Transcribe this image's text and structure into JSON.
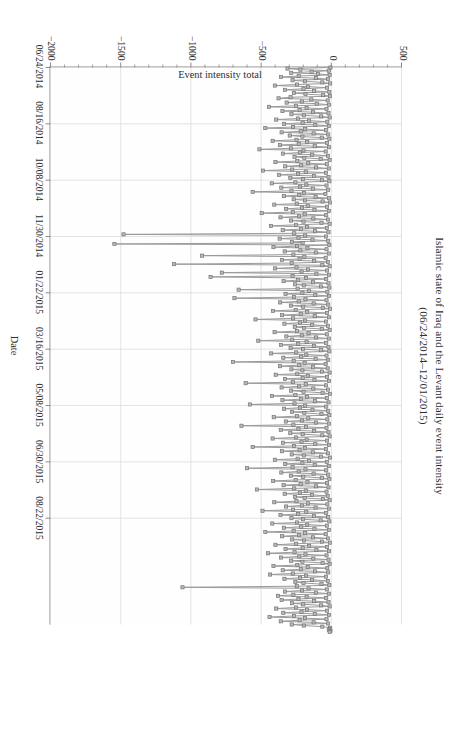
{
  "figure": {
    "title_line1": "Islamic state of Iraq and the Levant daily event intensity",
    "title_line2": "(06/24/2014–12/01/2015)",
    "orientation": "rotated-90-clockwise"
  },
  "colors": {
    "marker_fill": "#b9b9b9",
    "marker_stroke": "#6e6e6e",
    "line": "#9a9a9a",
    "axis": "#8a8a8a",
    "grid": "#dcdcdc",
    "text": "#2e2e2e",
    "background": "#ffffff"
  },
  "chart_data": {
    "type": "line",
    "title": "Islamic state of Iraq and the Levant daily event intensity (06/24/2014–12/01/2015)",
    "xlabel": "Date",
    "ylabel": "Event intensity total",
    "grid": true,
    "legend": false,
    "marker": "square",
    "xlim": [
      "06/24/2014",
      "12/01/2015"
    ],
    "ylim": [
      -2000,
      500
    ],
    "yticks": [
      500,
      0,
      -500,
      -1000,
      -1500,
      -2000
    ],
    "ytick_labels": [
      "500",
      "0",
      "−500",
      "−1000",
      "−1500",
      "−2000"
    ],
    "xtick_labels": [
      "06/24/2014",
      "08/16/2014",
      "10/08/2014",
      "11/30/2014",
      "01/22/2015",
      "03/16/2015",
      "05/08/2015",
      "06/30/2015",
      "08/22/2015"
    ],
    "xtick_positions": [
      0,
      53,
      106,
      159,
      212,
      265,
      318,
      371,
      424
    ],
    "x_total_days": 525,
    "series": [
      {
        "name": "Event intensity total",
        "values": [
          -6,
          -312,
          -220,
          -18,
          -140,
          -286,
          -96,
          -12,
          -232,
          -358,
          -110,
          -24,
          -276,
          -188,
          -64,
          -8,
          -244,
          -402,
          -166,
          -30,
          -198,
          -330,
          -122,
          -14,
          -266,
          -184,
          -58,
          -10,
          -290,
          -376,
          -142,
          -26,
          -210,
          -318,
          -104,
          -16,
          -252,
          -444,
          -176,
          -34,
          -226,
          -348,
          -130,
          -20,
          -284,
          -196,
          -72,
          -12,
          -238,
          -392,
          -158,
          -28,
          -204,
          -336,
          -114,
          -18,
          -272,
          -470,
          -186,
          -36,
          -218,
          -354,
          -126,
          -22,
          -296,
          -206,
          -68,
          -14,
          -248,
          -418,
          -172,
          -30,
          -232,
          -366,
          -118,
          -16,
          -288,
          -512,
          -198,
          -40,
          -224,
          -344,
          -136,
          -24,
          -262,
          -192,
          -76,
          -12,
          -242,
          -398,
          -164,
          -32,
          -214,
          -328,
          -108,
          -18,
          -278,
          -486,
          -182,
          -38,
          -236,
          -372,
          -124,
          -20,
          -292,
          -202,
          -66,
          -14,
          -256,
          -424,
          -178,
          -34,
          -222,
          -356,
          -132,
          -22,
          -284,
          -560,
          -194,
          -42,
          -228,
          -338,
          -112,
          -16,
          -268,
          -188,
          -62,
          -10,
          -246,
          -406,
          -168,
          -30,
          -208,
          -322,
          -120,
          -18,
          -274,
          -496,
          -190,
          -36,
          -230,
          -362,
          -128,
          -24,
          -286,
          -198,
          -70,
          -12,
          -252,
          -430,
          -174,
          -32,
          -216,
          -346,
          -116,
          -20,
          -264,
          -1480,
          -186,
          -38,
          -234,
          -368,
          -134,
          -22,
          -280,
          -204,
          -1545,
          -14,
          -244,
          -412,
          -170,
          -34,
          -220,
          -332,
          -110,
          -18,
          -270,
          -920,
          -192,
          -40,
          -226,
          -352,
          -122,
          -24,
          -282,
          -1120,
          -64,
          -12,
          -248,
          -400,
          -166,
          -30,
          -212,
          -780,
          -106,
          -16,
          -276,
          -860,
          -180,
          -36,
          -238,
          -340,
          -130,
          -20,
          -258,
          -196,
          -74,
          -14,
          -240,
          -660,
          -160,
          -28,
          -206,
          -326,
          -114,
          -18,
          -266,
          -690,
          -184,
          -34,
          -232,
          -364,
          -126,
          -22,
          -288,
          -200,
          -60,
          -10,
          -254,
          -416,
          -172,
          -30,
          -218,
          -350,
          -118,
          -16,
          -272,
          -540,
          -188,
          -38,
          -224,
          -334,
          -136,
          -24,
          -260,
          -194,
          -68,
          -12,
          -244,
          -404,
          -162,
          -32,
          -210,
          -320,
          -108,
          -18,
          -278,
          -520,
          -176,
          -36,
          -236,
          -358,
          -124,
          -20,
          -290,
          -202,
          -72,
          -14,
          -250,
          -428,
          -178,
          -34,
          -214,
          -342,
          -112,
          -22,
          -268,
          -700,
          -190,
          -40,
          -228,
          -366,
          -130,
          -26,
          -284,
          -206,
          -66,
          -12,
          -242,
          -396,
          -168,
          -30,
          -204,
          -330,
          -120,
          -16,
          -274,
          -610,
          -182,
          -38,
          -230,
          -354,
          -128,
          -24,
          -286,
          -198,
          -62,
          -10,
          -256,
          -422,
          -174,
          -32,
          -216,
          -348,
          -116,
          -20,
          -262,
          -580,
          -186,
          -36,
          -222,
          -336,
          -134,
          -22,
          -280,
          -192,
          -70,
          -14,
          -246,
          -410,
          -164,
          -28,
          -208,
          -324,
          -110,
          -18,
          -270,
          -640,
          -180,
          -34,
          -234,
          -360,
          -122,
          -20,
          -292,
          -204,
          -64,
          -12,
          -252,
          -418,
          -176,
          -30,
          -212,
          -344,
          -114,
          -16,
          -266,
          -560,
          -188,
          -38,
          -226,
          -352,
          -132,
          -24,
          -282,
          -196,
          -74,
          -10,
          -240,
          -402,
          -160,
          -32,
          -206,
          -328,
          -118,
          -18,
          -276,
          -600,
          -184,
          -36,
          -232,
          -356,
          -126,
          -22,
          -288,
          -200,
          -68,
          -14,
          -254,
          -414,
          -170,
          -30,
          -218,
          -340,
          -108,
          -20,
          -264,
          -530,
          -182,
          -34,
          -224,
          -332,
          -138,
          -26,
          -258,
          -190,
          -60,
          -12,
          -248,
          -406,
          -166,
          -28,
          -210,
          -322,
          -112,
          -16,
          -272,
          -490,
          -178,
          -36,
          -236,
          -362,
          -124,
          -22,
          -284,
          -202,
          -76,
          -14,
          -244,
          -420,
          -172,
          -32,
          -214,
          -338,
          -120,
          -18,
          -268,
          -470,
          -186,
          -40,
          -230,
          -350,
          -130,
          -24,
          -278,
          -194,
          -66,
          -10,
          -250,
          -398,
          -158,
          -30,
          -204,
          -326,
          -106,
          -16,
          -262,
          -450,
          -184,
          -34,
          -228,
          -358,
          -128,
          -20,
          -286,
          -206,
          -62,
          -12,
          -242,
          -412,
          -168,
          -28,
          -216,
          -346,
          -116,
          -22,
          -274,
          -436,
          -180,
          -38,
          -222,
          -334,
          -136,
          -24,
          -256,
          -198,
          -70,
          -14,
          -246,
          -1060,
          -162,
          -32,
          -208,
          -330,
          -110,
          -18,
          -270,
          -380,
          -176,
          -36,
          -234,
          -354,
          -122,
          -20,
          -280,
          -200,
          -72,
          -12,
          -252,
          -392,
          -174,
          -30,
          -212,
          -342,
          -118,
          -16,
          -266,
          -440,
          -188,
          -34,
          -226,
          -360,
          -126,
          -24,
          -282,
          -196,
          -64,
          -10,
          -8,
          -18,
          -6,
          -12
        ]
      }
    ],
    "notes": {
      "baseline_cluster": "Dense band of near-zero daily values runs the full length of the series.",
      "extreme_minima": [
        -1545,
        -1480,
        -1120,
        -1060
      ],
      "max_positive": 200
    }
  }
}
